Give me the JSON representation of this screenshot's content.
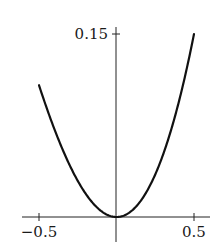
{
  "chart_data": {
    "type": "line",
    "title": "",
    "xlabel": "",
    "ylabel": "",
    "xlim": [
      -0.6,
      0.6
    ],
    "ylim": [
      -0.015,
      0.16
    ],
    "grid": false,
    "legend": null,
    "x_ticks": [
      {
        "value": -0.5,
        "label": "−0.5"
      },
      {
        "value": 0.5,
        "label": "0.5"
      }
    ],
    "y_ticks": [
      {
        "value": 0.15,
        "label": "0.15"
      }
    ],
    "series": [
      {
        "name": "curve",
        "color": "#111111",
        "x": [
          -0.5,
          -0.4,
          -0.3,
          -0.2,
          -0.1,
          0.0,
          0.1,
          0.2,
          0.3,
          0.4,
          0.5
        ],
        "y": [
          0.108,
          0.072,
          0.042,
          0.019,
          0.005,
          0.0,
          0.005,
          0.022,
          0.051,
          0.094,
          0.15
        ]
      }
    ]
  }
}
